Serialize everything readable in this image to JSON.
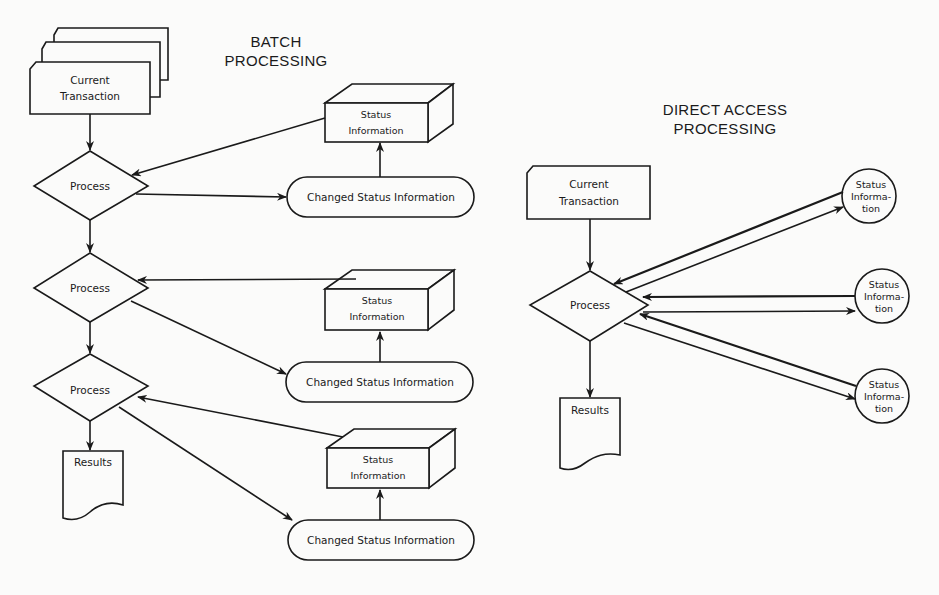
{
  "batch": {
    "title_line1": "BATCH",
    "title_line2": "PROCESSING",
    "transaction": {
      "line1": "Current",
      "line2": "Transaction"
    },
    "process_label": "Process",
    "results_label": "Results",
    "status_box": {
      "line1": "Status",
      "line2": "Information"
    },
    "changed_status_label": "Changed Status Information",
    "steps": [
      {
        "process": "Process",
        "status": "Status Information",
        "changed": "Changed Status Information"
      },
      {
        "process": "Process",
        "status": "Status Information",
        "changed": "Changed Status Information"
      },
      {
        "process": "Process",
        "status": "Status Information",
        "changed": "Changed Status Information"
      }
    ]
  },
  "direct": {
    "title_line1": "DIRECT ACCESS",
    "title_line2": "PROCESSING",
    "transaction": {
      "line1": "Current",
      "line2": "Transaction"
    },
    "process_label": "Process",
    "results_label": "Results",
    "status_circle": {
      "line1": "Status",
      "line2": "Informa-",
      "line3": "tion"
    },
    "status_count": 3
  },
  "colors": {
    "ink": "#1a1a1a",
    "paper": "#fbfbfa"
  }
}
